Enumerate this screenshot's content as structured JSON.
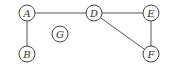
{
  "graph": {
    "nodes": [
      {
        "id": "A",
        "label": "A",
        "x": 27,
        "y": 13
      },
      {
        "id": "B",
        "label": "B",
        "x": 27,
        "y": 54
      },
      {
        "id": "G",
        "label": "G",
        "x": 60,
        "y": 34
      },
      {
        "id": "D",
        "label": "D",
        "x": 94,
        "y": 13
      },
      {
        "id": "E",
        "label": "E",
        "x": 151,
        "y": 13
      },
      {
        "id": "F",
        "label": "F",
        "x": 151,
        "y": 54
      }
    ],
    "edges": [
      [
        "A",
        "D"
      ],
      [
        "A",
        "B"
      ],
      [
        "D",
        "E"
      ],
      [
        "D",
        "F"
      ],
      [
        "E",
        "F"
      ]
    ],
    "node_radius": 8
  }
}
